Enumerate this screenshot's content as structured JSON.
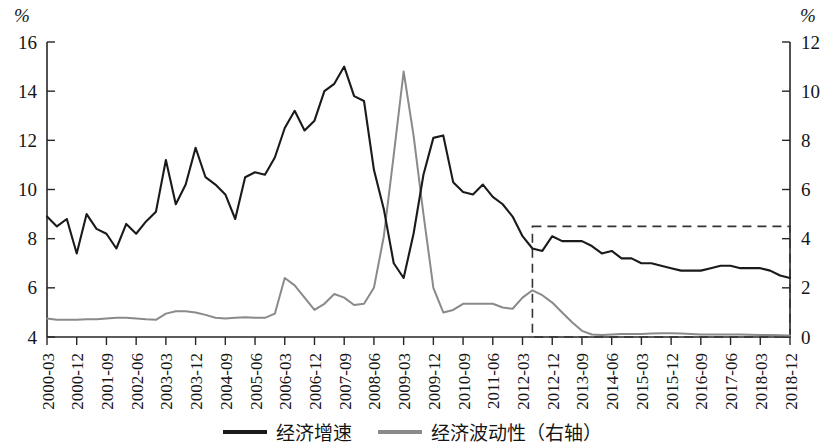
{
  "chart_data": {
    "type": "line",
    "title": "",
    "xlabel": "",
    "ylabel": "%",
    "y2label": "%",
    "grid": false,
    "legend_position": "bottom-center",
    "ylim": [
      4,
      16
    ],
    "y2lim": [
      0,
      12
    ],
    "yticks": [
      4,
      6,
      8,
      10,
      12,
      14,
      16
    ],
    "y2ticks": [
      0,
      2,
      4,
      6,
      8,
      10,
      12
    ],
    "xtick_labels": [
      "2000-03",
      "2000-12",
      "2001-09",
      "2002-06",
      "2003-03",
      "2003-12",
      "2004-09",
      "2005-06",
      "2006-03",
      "2006-12",
      "2007-09",
      "2008-06",
      "2009-03",
      "2009-12",
      "2010-09",
      "2011-06",
      "2012-03",
      "2012-12",
      "2013-09",
      "2014-06",
      "2015-03",
      "2015-12",
      "2016-09",
      "2017-06",
      "2018-03",
      "2018-12"
    ],
    "x_quarters": [
      "2000-03",
      "2000-06",
      "2000-09",
      "2000-12",
      "2001-03",
      "2001-06",
      "2001-09",
      "2001-12",
      "2002-03",
      "2002-06",
      "2002-09",
      "2002-12",
      "2003-03",
      "2003-06",
      "2003-09",
      "2003-12",
      "2004-03",
      "2004-06",
      "2004-09",
      "2004-12",
      "2005-03",
      "2005-06",
      "2005-09",
      "2005-12",
      "2006-03",
      "2006-06",
      "2006-09",
      "2006-12",
      "2007-03",
      "2007-06",
      "2007-09",
      "2007-12",
      "2008-03",
      "2008-06",
      "2008-09",
      "2008-12",
      "2009-03",
      "2009-06",
      "2009-09",
      "2009-12",
      "2010-03",
      "2010-06",
      "2010-09",
      "2010-12",
      "2011-03",
      "2011-06",
      "2011-09",
      "2011-12",
      "2012-03",
      "2012-06",
      "2012-09",
      "2012-12",
      "2013-03",
      "2013-06",
      "2013-09",
      "2013-12",
      "2014-03",
      "2014-06",
      "2014-09",
      "2014-12",
      "2015-03",
      "2015-06",
      "2015-09",
      "2015-12",
      "2016-03",
      "2016-06",
      "2016-09",
      "2016-12",
      "2017-03",
      "2017-06",
      "2017-09",
      "2017-12",
      "2018-03",
      "2018-06",
      "2018-09",
      "2018-12"
    ],
    "series": [
      {
        "name": "经济增速",
        "axis": "left",
        "color": "#1a1a1a",
        "values": [
          8.9,
          8.5,
          8.8,
          7.4,
          9.0,
          8.4,
          8.2,
          7.6,
          8.6,
          8.2,
          8.7,
          9.1,
          11.2,
          9.4,
          10.2,
          11.7,
          10.5,
          10.2,
          9.8,
          8.8,
          10.5,
          10.7,
          10.6,
          11.3,
          12.5,
          13.2,
          12.4,
          12.8,
          14.0,
          14.3,
          15.0,
          13.8,
          13.6,
          10.8,
          9.2,
          7.0,
          6.4,
          8.2,
          10.6,
          12.1,
          12.2,
          10.3,
          9.9,
          9.8,
          10.2,
          9.7,
          9.4,
          8.9,
          8.1,
          7.6,
          7.5,
          8.1,
          7.9,
          7.9,
          7.9,
          7.7,
          7.4,
          7.5,
          7.2,
          7.2,
          7.0,
          7.0,
          6.9,
          6.8,
          6.7,
          6.7,
          6.7,
          6.8,
          6.9,
          6.9,
          6.8,
          6.8,
          6.8,
          6.7,
          6.5,
          6.4
        ]
      },
      {
        "name": "经济波动性（右轴）",
        "axis": "right",
        "color": "#8a8a8a",
        "values": [
          0.75,
          0.7,
          0.7,
          0.7,
          0.72,
          0.72,
          0.75,
          0.78,
          0.78,
          0.75,
          0.72,
          0.7,
          0.95,
          1.05,
          1.05,
          1.0,
          0.9,
          0.78,
          0.75,
          0.78,
          0.8,
          0.78,
          0.78,
          0.95,
          2.4,
          2.1,
          1.6,
          1.1,
          1.35,
          1.75,
          1.6,
          1.3,
          1.35,
          2.0,
          4.1,
          7.4,
          10.8,
          8.2,
          5.0,
          2.0,
          1.0,
          1.1,
          1.35,
          1.35,
          1.35,
          1.35,
          1.2,
          1.15,
          1.6,
          1.9,
          1.7,
          1.4,
          1.0,
          0.6,
          0.25,
          0.1,
          0.08,
          0.1,
          0.12,
          0.12,
          0.12,
          0.14,
          0.15,
          0.15,
          0.14,
          0.12,
          0.1,
          0.1,
          0.1,
          0.1,
          0.1,
          0.09,
          0.08,
          0.08,
          0.07,
          0.06
        ]
      }
    ],
    "annotations": [
      {
        "type": "dashed-rectangle",
        "name": "new-normal-highlight-region",
        "x_start": "2012-06",
        "x_end": "2018-12",
        "y2_start": 0,
        "y2_end": 4.5
      }
    ]
  },
  "legend": {
    "items": [
      {
        "label": "经济增速",
        "swatch": "growth"
      },
      {
        "label": "经济波动性（右轴）",
        "swatch": "vol"
      }
    ]
  },
  "axes": {
    "left_unit": "%",
    "right_unit": "%"
  }
}
